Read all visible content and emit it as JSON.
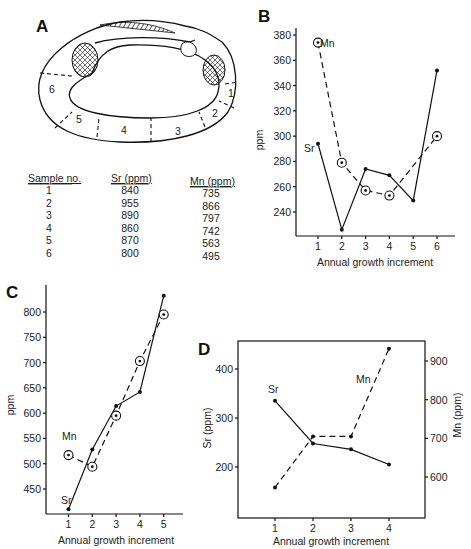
{
  "panels": {
    "A": {
      "letter": "A"
    },
    "B": {
      "letter": "B"
    },
    "C": {
      "letter": "C"
    },
    "D": {
      "letter": "D"
    }
  },
  "shell": {
    "zone_labels": [
      "1",
      "2",
      "3",
      "4",
      "5",
      "6"
    ]
  },
  "table": {
    "headers": [
      "Sample no.",
      "Sr (ppm)",
      "Mn (ppm)"
    ],
    "rows": [
      [
        "1",
        "840",
        "735"
      ],
      [
        "2",
        "955",
        "866"
      ],
      [
        "3",
        "890",
        "797"
      ],
      [
        "4",
        "860",
        "742"
      ],
      [
        "5",
        "870",
        "563"
      ],
      [
        "6",
        "800",
        "495"
      ]
    ]
  },
  "chart_data": [
    {
      "panel": "B",
      "type": "line",
      "title": "",
      "xlabel": "Annual growth increment",
      "ylabel": "ppm",
      "x_ticks": [
        "1",
        "2",
        "3",
        "4",
        "5",
        "6"
      ],
      "y_ticks": [
        "240",
        "260",
        "280",
        "300",
        "320",
        "340",
        "360",
        "380"
      ],
      "ylim": [
        220,
        390
      ],
      "grid": false,
      "series": [
        {
          "name": "Sr",
          "style": "solid",
          "marker": "dot",
          "x": [
            1,
            2,
            3,
            4,
            5,
            6
          ],
          "values": [
            294,
            226,
            274,
            269,
            249,
            352
          ]
        },
        {
          "name": "Mn",
          "style": "dashed",
          "marker": "ring",
          "x": [
            1,
            2,
            3,
            4,
            6
          ],
          "values": [
            374,
            279,
            257,
            253,
            300
          ]
        }
      ]
    },
    {
      "panel": "C",
      "type": "line",
      "title": "",
      "xlabel": "Annual growth increment",
      "ylabel": "ppm",
      "x_ticks": [
        "1",
        "2",
        "3",
        "4",
        "5"
      ],
      "y_ticks": [
        "450",
        "500",
        "550",
        "600",
        "650",
        "700",
        "750",
        "800"
      ],
      "ylim": [
        400,
        850
      ],
      "grid": false,
      "series": [
        {
          "name": "Sr",
          "style": "solid",
          "marker": "dot",
          "x": [
            1,
            2,
            3,
            4,
            5
          ],
          "values": [
            410,
            528,
            614,
            642,
            832
          ]
        },
        {
          "name": "Mn",
          "style": "dashed",
          "marker": "ring",
          "x": [
            1,
            2,
            3,
            4,
            5
          ],
          "values": [
            517,
            494,
            595,
            703,
            795
          ]
        }
      ]
    },
    {
      "panel": "D",
      "type": "line",
      "title": "",
      "xlabel": "Annual growth increment",
      "ylabel": "Sr (ppm)",
      "ylabel_right": "Mn (ppm)",
      "x_ticks": [
        "1",
        "2",
        "3",
        "4"
      ],
      "y_ticks": [
        "200",
        "300",
        "400"
      ],
      "y_ticks_right": [
        "600",
        "700",
        "800",
        "900"
      ],
      "ylim": [
        100,
        455
      ],
      "ylim_right": [
        500,
        950
      ],
      "grid": false,
      "series": [
        {
          "name": "Sr",
          "axis": "left",
          "style": "solid",
          "marker": "dot",
          "x": [
            1,
            2,
            3,
            4
          ],
          "values": [
            335,
            248,
            236,
            205
          ]
        },
        {
          "name": "Mn",
          "axis": "right",
          "style": "dashed",
          "marker": "dot",
          "x": [
            1,
            2,
            3,
            4
          ],
          "values": [
            573,
            705,
            705,
            932
          ]
        }
      ]
    }
  ]
}
